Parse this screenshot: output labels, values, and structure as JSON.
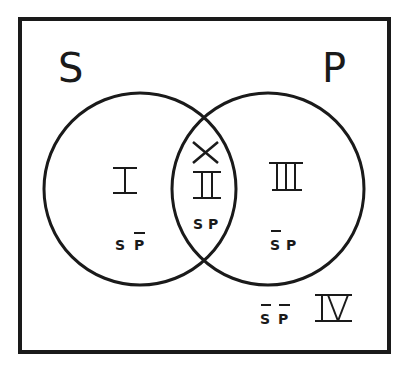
{
  "diagram": {
    "type": "venn",
    "title": "",
    "colors": {
      "line": "#1a1a1a",
      "background": "#ffffff"
    },
    "universe_box": {
      "x": 20,
      "y": 19,
      "width": 369,
      "height": 333
    },
    "sets": [
      {
        "id": "S",
        "label": "S",
        "cx": 140,
        "cy": 189,
        "r": 96
      },
      {
        "id": "P",
        "label": "P",
        "cx": 268,
        "cy": 189,
        "r": 96
      }
    ],
    "regions": [
      {
        "numeral": "I",
        "term": "SP̄",
        "term_letters": [
          "S",
          "P"
        ],
        "bars": [
          false,
          true
        ],
        "description": "S and not P"
      },
      {
        "numeral": "II",
        "term": "SP",
        "term_letters": [
          "S",
          "P"
        ],
        "bars": [
          false,
          false
        ],
        "description": "S and P",
        "marker": "X"
      },
      {
        "numeral": "III",
        "term": "S̄P",
        "term_letters": [
          "S",
          "P"
        ],
        "bars": [
          true,
          false
        ],
        "description": "not S and P"
      },
      {
        "numeral": "IV",
        "term": "S̄P̄",
        "term_letters": [
          "S",
          "P"
        ],
        "bars": [
          true,
          true
        ],
        "description": "not S and not P"
      }
    ],
    "marker": {
      "symbol": "X",
      "region": "II"
    }
  }
}
